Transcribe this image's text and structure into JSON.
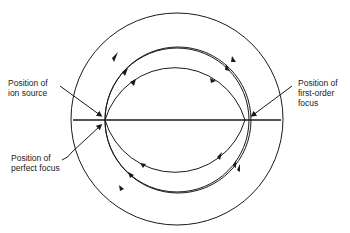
{
  "diagram": {
    "labels": {
      "ion_source_line1": "Position of",
      "ion_source_line2": "ion source",
      "perfect_focus_line1": "Position of",
      "perfect_focus_line2": "perfect focus",
      "first_order_line1": "Position of",
      "first_order_line2": "first-order",
      "first_order_line3": "focus"
    },
    "colors": {
      "stroke": "#1a1a1a",
      "background": "#ffffff"
    }
  }
}
